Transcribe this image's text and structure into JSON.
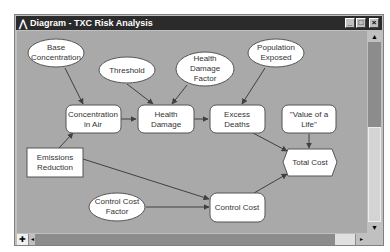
{
  "window": {
    "title": "Diagram - TXC Risk Analysis",
    "buttons": {
      "minimize": "_",
      "maximize": "□",
      "close": "×"
    }
  },
  "colors": {
    "titlebar": "#2b2b2b",
    "canvas": "#a9a9a9",
    "node_fill": "#ffffff",
    "arrow": "#404040"
  },
  "nodes": [
    {
      "id": "base_concentration",
      "type": "chance",
      "shape": "ellipse",
      "lines": [
        "Base",
        "Concentration"
      ]
    },
    {
      "id": "threshold",
      "type": "chance",
      "shape": "ellipse",
      "lines": [
        "Threshold"
      ]
    },
    {
      "id": "health_damage_factor",
      "type": "chance",
      "shape": "ellipse",
      "lines": [
        "Health",
        "Damage",
        "Factor"
      ]
    },
    {
      "id": "population_exposed",
      "type": "chance",
      "shape": "ellipse",
      "lines": [
        "Population",
        "Exposed"
      ]
    },
    {
      "id": "concentration_in_air",
      "type": "variable",
      "shape": "rounded-rect",
      "lines": [
        "Concentration",
        "in Air"
      ]
    },
    {
      "id": "health_damage",
      "type": "variable",
      "shape": "rounded-rect",
      "lines": [
        "Health",
        "Damage"
      ]
    },
    {
      "id": "excess_deaths",
      "type": "variable",
      "shape": "rounded-rect",
      "lines": [
        "Excess",
        "Deaths"
      ]
    },
    {
      "id": "value_of_a_life",
      "type": "variable",
      "shape": "rounded-rect",
      "lines": [
        "\"Value of a",
        "Life\""
      ]
    },
    {
      "id": "emissions_reduction",
      "type": "decision",
      "shape": "rect",
      "lines": [
        "Emissions",
        "Reduction"
      ]
    },
    {
      "id": "total_cost",
      "type": "objective",
      "shape": "hexagon",
      "lines": [
        "Total Cost"
      ]
    },
    {
      "id": "control_cost_factor",
      "type": "chance",
      "shape": "ellipse",
      "lines": [
        "Control Cost",
        "Factor"
      ]
    },
    {
      "id": "control_cost",
      "type": "variable",
      "shape": "rounded-rect",
      "lines": [
        "Control Cost"
      ]
    }
  ],
  "edges": [
    [
      "base_concentration",
      "concentration_in_air"
    ],
    [
      "emissions_reduction",
      "concentration_in_air"
    ],
    [
      "concentration_in_air",
      "health_damage"
    ],
    [
      "threshold",
      "health_damage"
    ],
    [
      "health_damage_factor",
      "health_damage"
    ],
    [
      "health_damage",
      "excess_deaths"
    ],
    [
      "population_exposed",
      "excess_deaths"
    ],
    [
      "excess_deaths",
      "total_cost"
    ],
    [
      "value_of_a_life",
      "total_cost"
    ],
    [
      "emissions_reduction",
      "control_cost"
    ],
    [
      "control_cost_factor",
      "control_cost"
    ],
    [
      "control_cost",
      "total_cost"
    ]
  ]
}
